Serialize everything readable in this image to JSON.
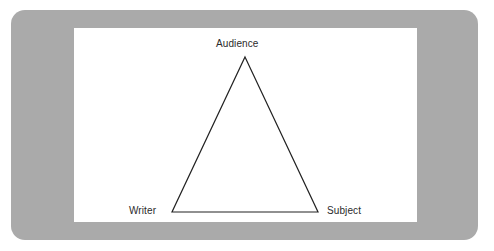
{
  "figure": {
    "title": "",
    "type": "rhetorical-triangle-diagram",
    "frame_color": "#aaaaaa",
    "canvas_color": "#ffffff",
    "line_color": "#222222",
    "label_color": "#2b2b2b"
  },
  "diagram": {
    "shape": "triangle",
    "vertices": [
      {
        "id": "audience",
        "label": "Audience",
        "x": 245,
        "y": 57,
        "label_position": "above"
      },
      {
        "id": "writer",
        "label": "Writer",
        "x": 172,
        "y": 212,
        "label_position": "left"
      },
      {
        "id": "subject",
        "label": "Subject",
        "x": 318,
        "y": 212,
        "label_position": "right"
      }
    ],
    "edges": [
      {
        "from": "writer",
        "to": "audience"
      },
      {
        "from": "audience",
        "to": "subject"
      },
      {
        "from": "writer",
        "to": "subject"
      }
    ]
  }
}
